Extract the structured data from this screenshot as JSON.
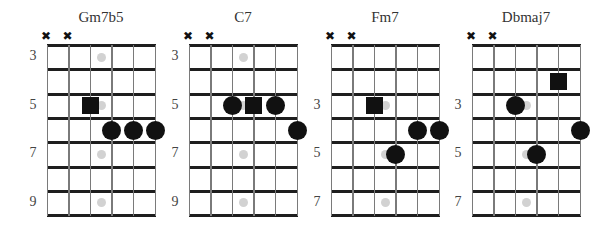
{
  "colors": {
    "fret_line": "#1e1e1e",
    "string_line": "#7a7a7a",
    "fret_marker": "#d2d2d2",
    "note": "#111111"
  },
  "legend": {
    "square": "root note",
    "circle": "chord tone",
    "x": "muted string",
    "gray_dot": "fret inlay marker"
  },
  "chords": [
    {
      "name": "Gm7b5",
      "muted_strings": [
        1,
        2
      ],
      "fret_labels": [
        {
          "text": "3",
          "space": 1
        },
        {
          "text": "5",
          "space": 3
        },
        {
          "text": "7",
          "space": 5
        },
        {
          "text": "9",
          "space": 7
        }
      ],
      "inlay_spaces": [
        1,
        3,
        5,
        7
      ],
      "notes": [
        {
          "shape": "square",
          "string": 3,
          "space": 3
        },
        {
          "shape": "circle",
          "string": 4,
          "space": 4
        },
        {
          "shape": "circle",
          "string": 5,
          "space": 4
        },
        {
          "shape": "circle",
          "string": 6,
          "space": 4
        }
      ]
    },
    {
      "name": "C7",
      "muted_strings": [
        1,
        2
      ],
      "fret_labels": [
        {
          "text": "3",
          "space": 1
        },
        {
          "text": "5",
          "space": 3
        },
        {
          "text": "7",
          "space": 5
        },
        {
          "text": "9",
          "space": 7
        }
      ],
      "inlay_spaces": [
        1,
        3,
        5,
        7
      ],
      "notes": [
        {
          "shape": "circle",
          "string": 3,
          "space": 3
        },
        {
          "shape": "square",
          "string": 4,
          "space": 3
        },
        {
          "shape": "circle",
          "string": 5,
          "space": 3
        },
        {
          "shape": "circle",
          "string": 6,
          "space": 4
        }
      ]
    },
    {
      "name": "Fm7",
      "muted_strings": [
        1,
        2
      ],
      "fret_labels": [
        {
          "text": "3",
          "space": 3
        },
        {
          "text": "5",
          "space": 5
        },
        {
          "text": "7",
          "space": 7
        }
      ],
      "inlay_spaces": [
        3,
        5,
        7
      ],
      "notes": [
        {
          "shape": "square",
          "string": 3,
          "space": 3
        },
        {
          "shape": "circle",
          "string": 5,
          "space": 4
        },
        {
          "shape": "circle",
          "string": 6,
          "space": 4
        },
        {
          "shape": "circle",
          "string": 4,
          "space": 5
        }
      ]
    },
    {
      "name": "Dbmaj7",
      "muted_strings": [
        1,
        2
      ],
      "fret_labels": [
        {
          "text": "3",
          "space": 3
        },
        {
          "text": "5",
          "space": 5
        },
        {
          "text": "7",
          "space": 7
        }
      ],
      "inlay_spaces": [
        3,
        5,
        7
      ],
      "notes": [
        {
          "shape": "square",
          "string": 5,
          "space": 2
        },
        {
          "shape": "circle",
          "string": 3,
          "space": 3
        },
        {
          "shape": "circle",
          "string": 6,
          "space": 4
        },
        {
          "shape": "circle",
          "string": 4,
          "space": 5
        }
      ]
    }
  ]
}
